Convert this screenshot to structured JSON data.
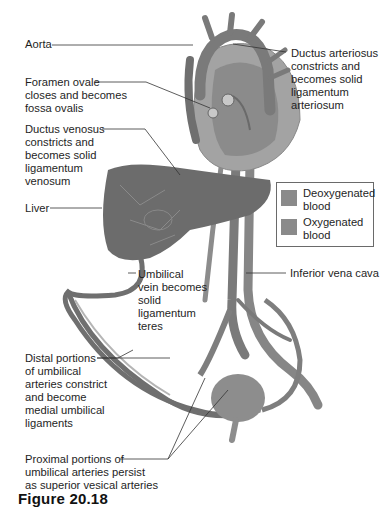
{
  "figure": {
    "caption": "Figure 20.18",
    "labels": {
      "aorta": "Aorta",
      "foramen_ovale": "Foramen ovale\ncloses and becomes\nfossa ovalis",
      "ductus_venosus": "Ductus venosus\nconstricts and\nbecomes solid\nligamentum\nvenosum",
      "liver": "Liver",
      "ductus_arteriosus": "Ductus arteriosus\nconstricts and\nbecomes solid\nligamentum\narteriosum",
      "inferior_vena_cava": "Inferior vena cava",
      "umbilical_vein": "Umbilical\nvein becomes\nsolid\nligamentum\nteres",
      "distal_umbilical_arteries": "Distal portions\nof umbilical\narteries constrict\nand become\nmedial umbilical\nligaments",
      "proximal_umbilical_arteries": "Proximal portions of\numbilical arteries persist\nas superior vesical arteries"
    },
    "legend": {
      "items": [
        {
          "label": "Deoxygenated\nblood",
          "color": "#8a8a8a"
        },
        {
          "label": "Oxygenated\nblood",
          "color": "#8a8a8a"
        }
      ]
    },
    "colors": {
      "vessel": "#7b7b7b",
      "vessel_dark": "#5a5a5a",
      "liver": "#6e6e6e",
      "heart": "#9a9a9a",
      "leader_line": "#333333"
    }
  }
}
